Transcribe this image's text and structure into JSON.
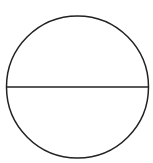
{
  "diagram": {
    "type": "circle-with-horizontal-diameter",
    "background": "#ffffff",
    "stroke_color": "#222222",
    "circle": {
      "cx": 77.5,
      "cy": 87,
      "r": 71,
      "stroke_width": 1.5
    },
    "diameter": {
      "x1": 6.5,
      "y1": 87,
      "x2": 148.5,
      "y2": 87,
      "stroke_width": 1.5
    }
  }
}
